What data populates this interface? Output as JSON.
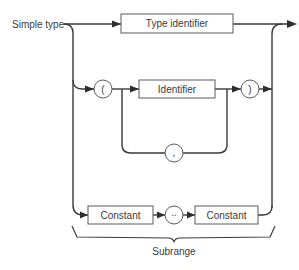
{
  "diagram": {
    "type": "syntax-diagram",
    "entry_label": "Simple type",
    "nodes": {
      "type_identifier": "Type identifier",
      "open_paren": "(",
      "identifier": "Identifier",
      "close_paren": ")",
      "comma": ",",
      "constant_1": "Constant",
      "range_dots": "..",
      "constant_2": "Constant"
    },
    "brace_label": "Subrange",
    "colors": {
      "line": "#3a3a3a",
      "box_border": "#5a5a5a",
      "background": "#ffffff"
    }
  }
}
